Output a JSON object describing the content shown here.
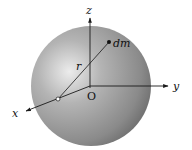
{
  "diagram": {
    "colors": {
      "sphere_highlight": "#e4e4e4",
      "sphere_mid": "#a8a8a8",
      "sphere_shadow": "#6e6e6e",
      "axis": "#1a1a1a"
    },
    "labels": {
      "z_axis": "z",
      "y_axis": "y",
      "x_axis": "x",
      "origin": "O",
      "radius": "r",
      "mass_element": "dm"
    }
  }
}
